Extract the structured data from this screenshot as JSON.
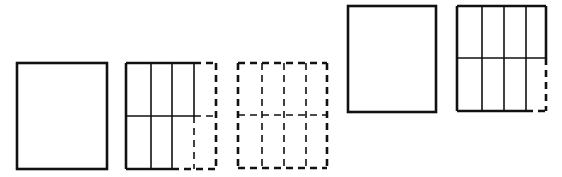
{
  "canvas": {
    "width": 562,
    "height": 177,
    "background": "#ffffff"
  },
  "style": {
    "stroke_color": "#111111",
    "outer_stroke_width": 2.6,
    "inner_stroke_width": 1.6,
    "dash_pattern": "7,5"
  },
  "figures": [
    {
      "id": "panel-1",
      "description": "Blank solid rectangle",
      "x": 17,
      "y": 63,
      "width": 90,
      "height": 106,
      "columns": 1,
      "rows": 1,
      "style": "solid"
    },
    {
      "id": "panel-2",
      "description": "Rectangle split into 4 columns x 2 rows; first three top cells and first two bottom cells solid, remaining cells dashed",
      "x": 126,
      "y": 63,
      "width": 90,
      "height": 106,
      "column_dividers_x": [
        151,
        172,
        194
      ],
      "row_divider_y": 116,
      "style": "mixed"
    },
    {
      "id": "panel-3",
      "description": "Rectangle split into 4 columns x 2 rows, entirely dashed",
      "x": 238,
      "y": 63,
      "width": 89,
      "height": 105,
      "column_dividers_x": [
        262,
        284,
        306
      ],
      "row_divider_y": 115,
      "style": "dashed"
    },
    {
      "id": "panel-4",
      "description": "Blank solid rectangle (raised)",
      "x": 348,
      "y": 6,
      "width": 88,
      "height": 106,
      "columns": 1,
      "rows": 1,
      "style": "solid"
    },
    {
      "id": "panel-5",
      "description": "Rectangle split into 4 columns x 2 rows; all solid except bottom-right cell's right and bottom edges dashed",
      "x": 457,
      "y": 6,
      "width": 89,
      "height": 105,
      "column_dividers_x": [
        482,
        504,
        526
      ],
      "row_divider_y": 58,
      "style": "mostly-solid"
    }
  ]
}
